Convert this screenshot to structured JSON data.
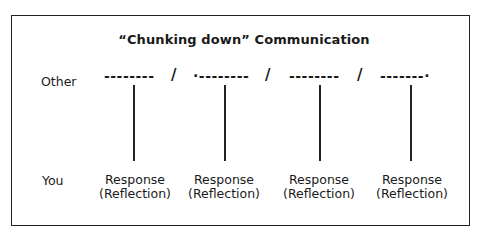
{
  "diagram": {
    "title": "“Chunking down” Communication",
    "rows": {
      "other_label": "Other",
      "you_label": "You"
    },
    "other_segments": [
      {
        "dashes": "--------"
      },
      {
        "dashes": "·--------"
      },
      {
        "dashes": "--------"
      },
      {
        "dashes": "-------·"
      }
    ],
    "separator": "/",
    "responses": [
      {
        "line1": "Response",
        "line2": "(Reflection)"
      },
      {
        "line1": "Response",
        "line2": "(Reflection)"
      },
      {
        "line1": "Response",
        "line2": "(Reflection)"
      },
      {
        "line1": "Response",
        "line2": "(Reflection)"
      }
    ]
  }
}
